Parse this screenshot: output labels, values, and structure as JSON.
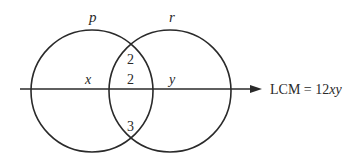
{
  "diagram": {
    "type": "venn",
    "circles": [
      {
        "id": "p",
        "label": "p",
        "cx": 92,
        "cy": 91,
        "r": 61
      },
      {
        "id": "r",
        "label": "r",
        "cx": 170,
        "cy": 91,
        "r": 61
      }
    ],
    "regions": {
      "p_only": "x",
      "intersection_top": "2",
      "intersection_middle": "2",
      "intersection_bottom": "3",
      "r_only": "y"
    },
    "arrow": {
      "label_prefix": "LCM = 12",
      "label_vars": "xy"
    },
    "stroke_color": "#2a2a2a"
  }
}
